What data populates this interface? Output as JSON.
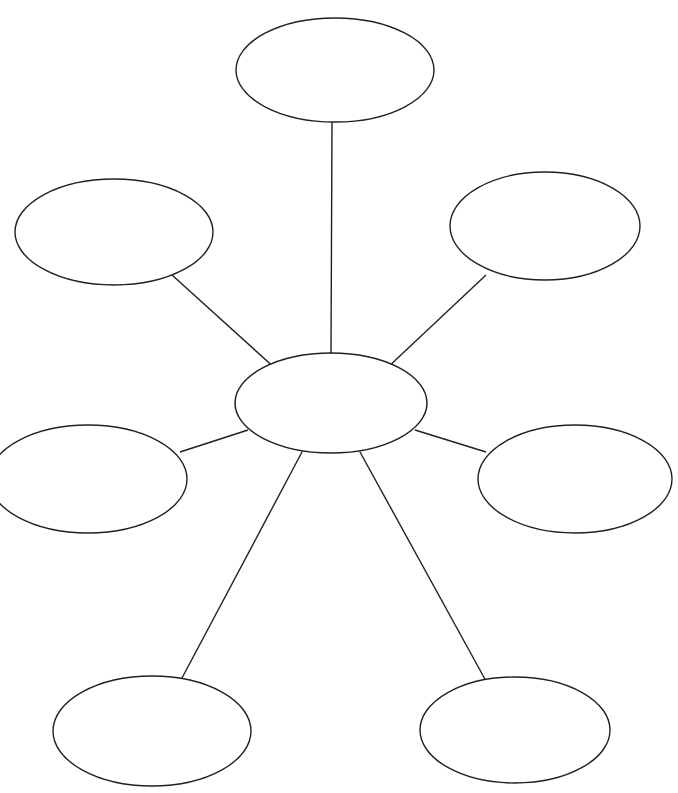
{
  "document": {
    "title": "Spider Web Concept Map",
    "type": "blank-graphic-organizer",
    "background_color": "#ffffff",
    "stroke_color": "#231f20",
    "fill_color": "#ffffff",
    "width": 678,
    "height": 793
  },
  "diagram": {
    "kind": "spider-map",
    "center": {
      "id": "center",
      "label": "",
      "cx": 331,
      "cy": 403,
      "rx": 96,
      "ry": 50
    },
    "nodes": [
      {
        "id": "node-top",
        "label": "",
        "position": "top",
        "cx": 335,
        "cy": 70,
        "rx": 99,
        "ry": 52
      },
      {
        "id": "node-upper-left",
        "label": "",
        "position": "upper-left",
        "cx": 114,
        "cy": 232,
        "rx": 99,
        "ry": 53
      },
      {
        "id": "node-upper-right",
        "label": "",
        "position": "upper-right",
        "cx": 545,
        "cy": 226,
        "rx": 95,
        "ry": 54
      },
      {
        "id": "node-mid-left",
        "label": "",
        "position": "middle-left",
        "cx": 88,
        "cy": 479,
        "rx": 99,
        "ry": 54
      },
      {
        "id": "node-mid-right",
        "label": "",
        "position": "middle-right",
        "cx": 575,
        "cy": 479,
        "rx": 97,
        "ry": 54
      },
      {
        "id": "node-bottom-left",
        "label": "",
        "position": "bottom-left",
        "cx": 152,
        "cy": 731,
        "rx": 99,
        "ry": 55
      },
      {
        "id": "node-bottom-right",
        "label": "",
        "position": "bottom-right",
        "cx": 515,
        "cy": 730,
        "rx": 95,
        "ry": 53
      }
    ],
    "connectors": [
      {
        "id": "link-center-top",
        "from": "center",
        "to": "node-top",
        "x1": 331,
        "y1": 353,
        "x2": 332,
        "y2": 122
      },
      {
        "id": "link-center-upper-left",
        "from": "center",
        "to": "node-upper-left",
        "x1": 277,
        "y1": 370,
        "x2": 172,
        "y2": 275
      },
      {
        "id": "link-center-upper-right",
        "from": "center",
        "to": "node-upper-right",
        "x1": 386,
        "y1": 369,
        "x2": 486,
        "y2": 275
      },
      {
        "id": "link-center-mid-left",
        "from": "center",
        "to": "node-mid-left",
        "x1": 248,
        "y1": 430,
        "x2": 180,
        "y2": 452
      },
      {
        "id": "link-center-mid-right",
        "from": "center",
        "to": "node-mid-right",
        "x1": 415,
        "y1": 430,
        "x2": 486,
        "y2": 452
      },
      {
        "id": "link-center-bottom-left",
        "from": "center",
        "to": "node-bottom-left",
        "x1": 302,
        "y1": 452,
        "x2": 182,
        "y2": 678
      },
      {
        "id": "link-center-bottom-right",
        "from": "center",
        "to": "node-bottom-right",
        "x1": 360,
        "y1": 452,
        "x2": 486,
        "y2": 681
      }
    ]
  }
}
